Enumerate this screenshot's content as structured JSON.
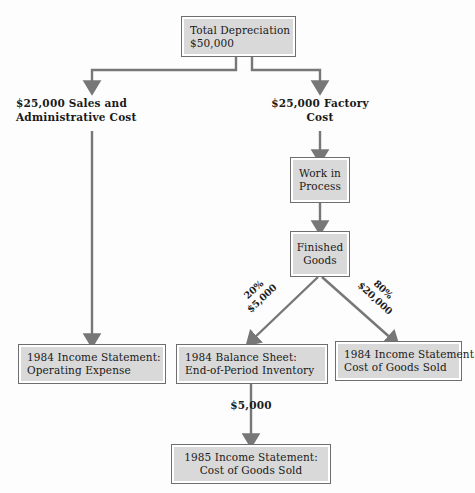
{
  "diagram": {
    "title_node": {
      "lines": [
        "Total Depreciation",
        "$50,000"
      ]
    },
    "branch_labels": {
      "left": [
        "$25,000 Sales and",
        "Administrative Cost"
      ],
      "right": [
        "$25,000 Factory",
        "Cost"
      ]
    },
    "factory_chain": {
      "wip": [
        "Work in",
        "Process"
      ],
      "finished": [
        "Finished",
        "Goods"
      ]
    },
    "split_labels": {
      "left_pct": "20%",
      "left_amount": "$5,000",
      "right_pct": "80%",
      "right_amount": "$20,000"
    },
    "outcomes": {
      "operating_expense": [
        "1984 Income Statement:",
        "Operating Expense"
      ],
      "balance_sheet": [
        "1984 Balance Sheet:",
        "End-of-Period Inventory"
      ],
      "cogs_1984": [
        "1984 Income Statement:",
        "Cost of Goods Sold"
      ],
      "cogs_1985": [
        "1985 Income Statement:",
        "Cost of Goods Sold"
      ]
    },
    "carryover_label": "$5,000",
    "colors": {
      "node_fill": "#d9d9d9",
      "node_border": "#6e6e6e",
      "wire": "#777777",
      "text": "#1a1a1a",
      "background": "#fdfdfd"
    }
  }
}
